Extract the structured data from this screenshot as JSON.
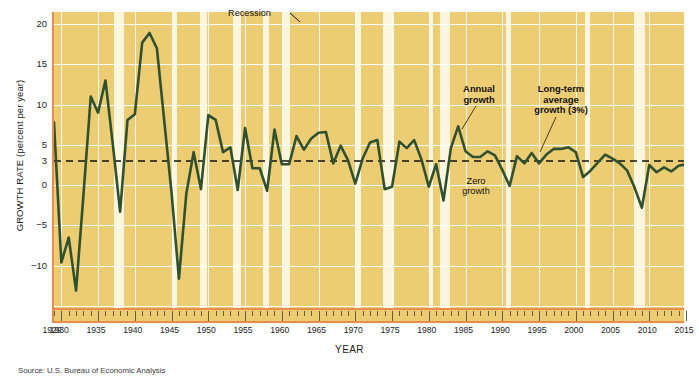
{
  "chart_data": {
    "type": "line",
    "title": "",
    "xlabel": "YEAR",
    "ylabel": "GROWTH RATE (percent per year)",
    "source": "Source: U.S. Bureau of Economic Analysis",
    "xlim": [
      1929,
      2015
    ],
    "ylim": [
      -15.5,
      21.5
    ],
    "grid": true,
    "y_ticks": [
      20,
      15,
      10,
      5,
      3,
      0,
      -5,
      -10
    ],
    "y_tick_labels": [
      "20",
      "15",
      "10",
      "5",
      "3",
      "0",
      "−5",
      "−10"
    ],
    "x_tick_labels": [
      "1929",
      "1930",
      "1935",
      "1940",
      "1945",
      "1950",
      "1955",
      "1960",
      "1965",
      "1970",
      "1975",
      "1980",
      "1985",
      "1990",
      "1995",
      "2000",
      "2005",
      "2010",
      "2015"
    ],
    "x_tick_values": [
      1929,
      1930,
      1935,
      1940,
      1945,
      1950,
      1955,
      1960,
      1965,
      1970,
      1975,
      1980,
      1985,
      1990,
      1995,
      2000,
      2005,
      2010,
      2015
    ],
    "x_gridlines": [
      1930,
      1935,
      1940,
      1945,
      1950,
      1955,
      1960,
      1965,
      1970,
      1975,
      1980,
      1985,
      1990,
      1995,
      2000,
      2005,
      2010,
      2015
    ],
    "reference_line": {
      "label": "Long-term average growth (3%)",
      "value": 3,
      "style": "dashed",
      "color": "#111111"
    },
    "series": [
      {
        "name": "Annual growth",
        "color": "#2f5130",
        "x": [
          1929,
          1930,
          1931,
          1932,
          1933,
          1934,
          1935,
          1936,
          1937,
          1938,
          1939,
          1940,
          1941,
          1942,
          1943,
          1944,
          1945,
          1946,
          1947,
          1948,
          1949,
          1950,
          1951,
          1952,
          1953,
          1954,
          1955,
          1956,
          1957,
          1958,
          1959,
          1960,
          1961,
          1962,
          1963,
          1964,
          1965,
          1966,
          1967,
          1968,
          1969,
          1970,
          1971,
          1972,
          1973,
          1974,
          1975,
          1976,
          1977,
          1978,
          1979,
          1980,
          1981,
          1982,
          1983,
          1984,
          1985,
          1986,
          1987,
          1988,
          1989,
          1990,
          1991,
          1992,
          1993,
          1994,
          1995,
          1996,
          1997,
          1998,
          1999,
          2000,
          2001,
          2002,
          2003,
          2004,
          2005,
          2006,
          2007,
          2008,
          2009,
          2010,
          2011,
          2012,
          2013,
          2014,
          2015
        ],
        "values": [
          7.8,
          -9.6,
          -6.5,
          -13.1,
          -1.3,
          11.0,
          9.0,
          13.0,
          5.1,
          -3.3,
          8.1,
          8.8,
          17.7,
          18.9,
          17.0,
          8.0,
          -1.0,
          -11.6,
          -1.1,
          4.1,
          -0.5,
          8.7,
          8.1,
          4.1,
          4.7,
          -0.6,
          7.1,
          2.1,
          2.1,
          -0.7,
          6.9,
          2.6,
          2.6,
          6.1,
          4.4,
          5.8,
          6.5,
          6.6,
          2.7,
          4.9,
          3.1,
          0.2,
          3.3,
          5.3,
          5.6,
          -0.5,
          -0.2,
          5.4,
          4.6,
          5.6,
          3.2,
          -0.2,
          2.6,
          -1.9,
          4.6,
          7.3,
          4.2,
          3.5,
          3.5,
          4.2,
          3.7,
          1.9,
          -0.1,
          3.6,
          2.7,
          4.0,
          2.7,
          3.8,
          4.5,
          4.5,
          4.7,
          4.1,
          1.0,
          1.8,
          2.8,
          3.8,
          3.3,
          2.7,
          1.8,
          -0.3,
          -2.8,
          2.5,
          1.6,
          2.2,
          1.7,
          2.4,
          2.6
        ]
      }
    ],
    "recession_bands": [
      {
        "start": 1937.2,
        "end": 1938.5
      },
      {
        "start": 1945.0,
        "end": 1945.8
      },
      {
        "start": 1948.8,
        "end": 1949.8
      },
      {
        "start": 1953.4,
        "end": 1954.4
      },
      {
        "start": 1957.5,
        "end": 1958.3
      },
      {
        "start": 1960.2,
        "end": 1961.1
      },
      {
        "start": 1969.9,
        "end": 1970.8
      },
      {
        "start": 1973.8,
        "end": 1975.2
      },
      {
        "start": 1980.0,
        "end": 1980.6
      },
      {
        "start": 1981.5,
        "end": 1982.9
      },
      {
        "start": 1990.5,
        "end": 1991.2
      },
      {
        "start": 2001.2,
        "end": 2001.9
      },
      {
        "start": 2007.9,
        "end": 2009.4
      }
    ],
    "annotations": [
      {
        "name": "recession",
        "text": "Recession"
      },
      {
        "name": "annual-growth",
        "text": "Annual\ngrowth"
      },
      {
        "name": "long-term-average",
        "text": "Long-term\naverage\ngrowth (3%)"
      },
      {
        "name": "zero-growth",
        "text": "Zero\ngrowth"
      }
    ],
    "annotation_text": {
      "recession": "Recession",
      "annual_growth_l1": "Annual",
      "annual_growth_l2": "growth",
      "long_term_l1": "Long-term",
      "long_term_l2": "average",
      "long_term_l3": "growth (3%)",
      "zero_growth_l1": "Zero",
      "zero_growth_l2": "growth"
    },
    "colors": {
      "plot_background": "#edcd73",
      "recession_band": "#fdf6df",
      "line": "#2f5130",
      "axis": "#e98c4a",
      "gridline": "#ffffff",
      "reference_line": "#111111"
    }
  }
}
